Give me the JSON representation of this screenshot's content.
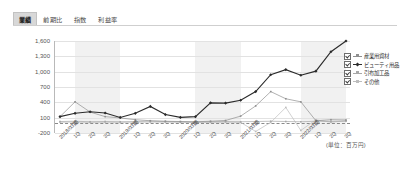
{
  "tabs": [
    {
      "label": "業績",
      "active": true
    },
    {
      "label": "前期比",
      "active": false
    },
    {
      "label": "指数",
      "active": false
    },
    {
      "label": "利益率",
      "active": false
    }
  ],
  "unit_note": "(単位：百万円)",
  "legend": {
    "items": [
      {
        "label": "産業用資材",
        "color": "#8f8f8f",
        "checked": true,
        "marker": "plus"
      },
      {
        "label": "ビューティ用品",
        "color": "#2b2b2b",
        "checked": true,
        "marker": "diamond"
      },
      {
        "label": "引布加工品",
        "color": "#a8a8a8",
        "checked": true,
        "marker": "triangle"
      },
      {
        "label": "その他",
        "color": "#bdbdbd",
        "checked": true,
        "marker": "square"
      }
    ]
  },
  "chart_data": {
    "type": "line",
    "title": "",
    "xlabel": "",
    "ylabel": "",
    "ylim": [
      -200,
      1600
    ],
    "yticks": [
      1600,
      1300,
      1000,
      700,
      400,
      100,
      -200
    ],
    "ytick_labels": [
      "1,600",
      "1,300",
      "1,000",
      "700",
      "400",
      "100",
      "-200"
    ],
    "grid": true,
    "legend_position": "right",
    "categories": [
      "2018/03期",
      "1Q",
      "2Q",
      "3Q",
      "2019/03期",
      "1Q",
      "2Q",
      "3Q",
      "2020/03期",
      "1Q",
      "2Q",
      "3Q",
      "2021/03期",
      "1Q",
      "2Q",
      "3Q",
      "2022/03期",
      "1Q",
      "2Q",
      "3Q"
    ],
    "series": [
      {
        "name": "産業用資材",
        "color": "#8f8f8f",
        "values": [
          120,
          410,
          210,
          120,
          95,
          60,
          40,
          30,
          25,
          20,
          30,
          45,
          130,
          330,
          610,
          470,
          410,
          40,
          60,
          55
        ]
      },
      {
        "name": "ビューティ用品",
        "color": "#2b2b2b",
        "values": [
          120,
          185,
          215,
          190,
          105,
          185,
          320,
          160,
          105,
          120,
          390,
          385,
          440,
          610,
          940,
          1040,
          930,
          1010,
          1390,
          1600
        ]
      },
      {
        "name": "引布加工品",
        "color": "#a8a8a8",
        "values": [
          25,
          30,
          20,
          25,
          20,
          25,
          30,
          25,
          20,
          15,
          20,
          25,
          20,
          25,
          30,
          25,
          20,
          30,
          25,
          30
        ]
      },
      {
        "name": "その他",
        "color": "#bdbdbd",
        "values": [
          10,
          12,
          8,
          10,
          8,
          10,
          12,
          10,
          8,
          5,
          8,
          10,
          8,
          -170,
          8,
          300,
          -150,
          60,
          10,
          40
        ]
      }
    ],
    "bands": [
      {
        "from_index": 1,
        "to_index": 4
      },
      {
        "from_index": 9,
        "to_index": 12
      },
      {
        "from_index": 16,
        "to_index": 19
      }
    ]
  }
}
